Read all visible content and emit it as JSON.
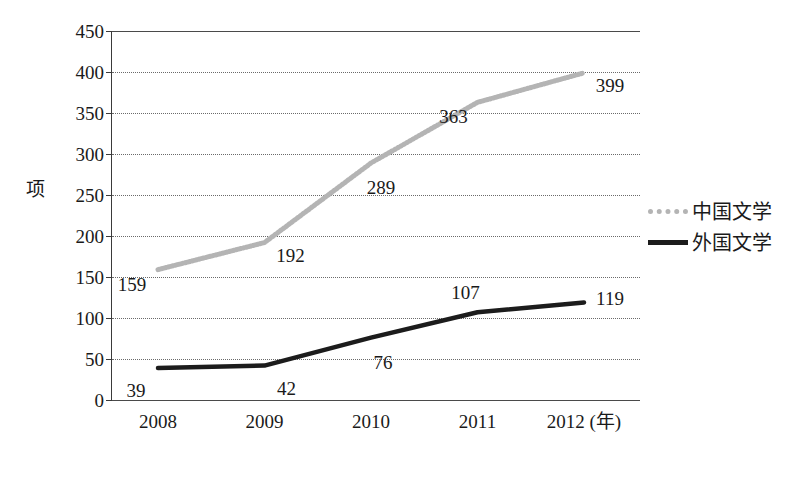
{
  "chart_data": {
    "type": "line",
    "title": "",
    "xlabel": "年",
    "ylabel": "项",
    "x": [
      "2008",
      "2009",
      "2010",
      "2011",
      "2012"
    ],
    "categories": [
      "2008",
      "2009",
      "2010",
      "2011",
      "2012"
    ],
    "xtick_labels": [
      "2008",
      "2009",
      "2010",
      "2011",
      "2012 (年)"
    ],
    "ylim": [
      0,
      450
    ],
    "ytick_values": [
      0,
      50,
      100,
      150,
      200,
      250,
      300,
      350,
      400,
      450
    ],
    "ytick_labels": [
      "0",
      "50",
      "100",
      "150",
      "200",
      "250",
      "300",
      "350",
      "400",
      "450"
    ],
    "grid": true,
    "legend_position": "right",
    "series": [
      {
        "name": "中国文学",
        "color": "#b4b4b4",
        "style": "dotted",
        "values": [
          159,
          192,
          289,
          363,
          399
        ],
        "labels": [
          "159",
          "192",
          "289",
          "363",
          "399"
        ]
      },
      {
        "name": "外国文学",
        "color": "#1c1c1c",
        "style": "solid",
        "values": [
          39,
          42,
          76,
          107,
          119
        ],
        "labels": [
          "39",
          "42",
          "76",
          "107",
          "119"
        ]
      }
    ]
  },
  "axis": {
    "unit_label": "项",
    "x_unit_suffix": "(年)"
  },
  "legend": {
    "items": [
      {
        "label": "中国文学"
      },
      {
        "label": "外国文学"
      }
    ]
  },
  "caption": {
    "text": ""
  }
}
